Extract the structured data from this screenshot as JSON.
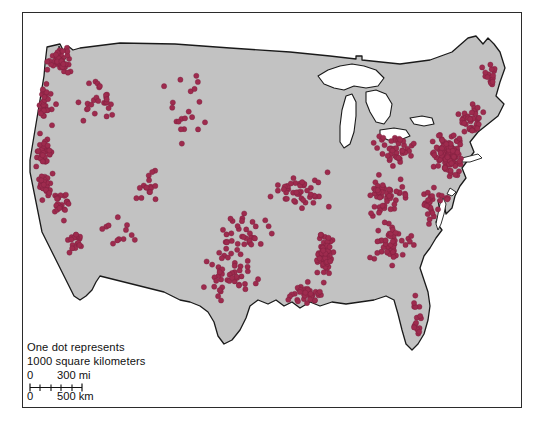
{
  "figure": {
    "kind": "dot-density-map",
    "region": "conterminous-united-states",
    "frame": {
      "x": 22,
      "y": 12,
      "width": 500,
      "height": 396
    }
  },
  "colors": {
    "dot": "#9e2b4e",
    "dot_stroke": "#7a1f3c",
    "land": "#c2c2c2",
    "land_outline": "#1a1a1a",
    "water": "#ffffff",
    "frame": "#2b2b2b",
    "background": "#ffffff",
    "text": "#111111"
  },
  "legend": {
    "line1": "One dot represents",
    "line2": "1000 square kilometers",
    "scale": {
      "miles": {
        "zero": "0",
        "far": "300 mi",
        "far_value": 300,
        "unit": "mi"
      },
      "kilometers": {
        "zero": "0",
        "far": "500 km",
        "far_value": 500,
        "unit": "km"
      },
      "bar_length_px": 50,
      "tick_count": 6
    }
  },
  "chart_data": {
    "type": "scatter",
    "title": "",
    "xlabel": "",
    "ylabel": "",
    "dot_radius_px": 2.6,
    "clusters": [
      {
        "name": "puget-sound",
        "cx": 60,
        "cy": 62,
        "count": 46,
        "spread_x": 16,
        "spread_y": 20
      },
      {
        "name": "oregon-coast",
        "cx": 46,
        "cy": 105,
        "count": 30,
        "spread_x": 12,
        "spread_y": 24
      },
      {
        "name": "northern-california",
        "cx": 44,
        "cy": 152,
        "count": 34,
        "spread_x": 13,
        "spread_y": 22
      },
      {
        "name": "bay-area",
        "cx": 44,
        "cy": 185,
        "count": 26,
        "spread_x": 10,
        "spread_y": 14
      },
      {
        "name": "central-valley",
        "cx": 62,
        "cy": 205,
        "count": 24,
        "spread_x": 11,
        "spread_y": 22
      },
      {
        "name": "southern-california",
        "cx": 76,
        "cy": 240,
        "count": 18,
        "spread_x": 12,
        "spread_y": 14
      },
      {
        "name": "idaho-montana-west",
        "cx": 100,
        "cy": 95,
        "count": 26,
        "spread_x": 24,
        "spread_y": 32
      },
      {
        "name": "colorado-front-range",
        "cx": 150,
        "cy": 185,
        "count": 16,
        "spread_x": 14,
        "spread_y": 22
      },
      {
        "name": "desert-southwest-sparse",
        "cx": 120,
        "cy": 235,
        "count": 12,
        "spread_x": 26,
        "spread_y": 22
      },
      {
        "name": "northern-plains-sparse",
        "cx": 190,
        "cy": 110,
        "count": 20,
        "spread_x": 40,
        "spread_y": 36
      },
      {
        "name": "texas",
        "cx": 230,
        "cy": 275,
        "count": 48,
        "spread_x": 38,
        "spread_y": 34
      },
      {
        "name": "oklahoma-kansas",
        "cx": 240,
        "cy": 235,
        "count": 34,
        "spread_x": 34,
        "spread_y": 24
      },
      {
        "name": "midwest-corn-belt",
        "cx": 300,
        "cy": 190,
        "count": 44,
        "spread_x": 32,
        "spread_y": 28
      },
      {
        "name": "mississippi-valley",
        "cx": 325,
        "cy": 255,
        "count": 60,
        "spread_x": 12,
        "spread_y": 38
      },
      {
        "name": "gulf-coast",
        "cx": 305,
        "cy": 295,
        "count": 34,
        "spread_x": 26,
        "spread_y": 16
      },
      {
        "name": "southeast-piedmont",
        "cx": 390,
        "cy": 245,
        "count": 46,
        "spread_x": 28,
        "spread_y": 28
      },
      {
        "name": "appalachia-ohio",
        "cx": 385,
        "cy": 195,
        "count": 52,
        "spread_x": 26,
        "spread_y": 26
      },
      {
        "name": "great-lakes-east",
        "cx": 395,
        "cy": 150,
        "count": 44,
        "spread_x": 24,
        "spread_y": 22
      },
      {
        "name": "northeast-corridor",
        "cx": 448,
        "cy": 155,
        "count": 130,
        "spread_x": 18,
        "spread_y": 22
      },
      {
        "name": "new-england",
        "cx": 470,
        "cy": 120,
        "count": 40,
        "spread_x": 18,
        "spread_y": 22
      },
      {
        "name": "maine",
        "cx": 488,
        "cy": 78,
        "count": 16,
        "spread_x": 11,
        "spread_y": 18
      },
      {
        "name": "mid-atlantic-coast",
        "cx": 435,
        "cy": 205,
        "count": 30,
        "spread_x": 16,
        "spread_y": 22
      },
      {
        "name": "florida",
        "cx": 418,
        "cy": 320,
        "count": 16,
        "spread_x": 10,
        "spread_y": 30
      }
    ],
    "total_dots_approx": 900,
    "grid": false,
    "legend_position": "bottom-left"
  }
}
